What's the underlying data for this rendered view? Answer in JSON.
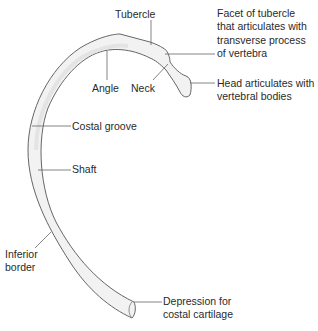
{
  "diagram": {
    "colors": {
      "bone_fill": "#f2f2f2",
      "bone_outline": "#555555",
      "leader_line": "#666666",
      "text": "#2a2a2a",
      "background": "#ffffff"
    },
    "labels": {
      "tubercle": "Tubercle",
      "facet_line1": "Facet of tubercle",
      "facet_line2": "that articulates with",
      "facet_line3": "transverse process",
      "facet_line4": "of vertebra",
      "angle": "Angle",
      "neck": "Neck",
      "head_line1": "Head articulates with",
      "head_line2": "vertebral bodies",
      "costal_groove": "Costal groove",
      "shaft": "Shaft",
      "inferior_line1": "Inferior",
      "inferior_line2": "border",
      "depression_line1": "Depression for",
      "depression_line2": "costal cartilage"
    }
  }
}
